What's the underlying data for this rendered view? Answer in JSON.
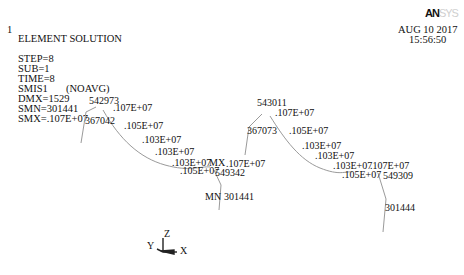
{
  "header": {
    "window_number": "1",
    "title": "ELEMENT SOLUTION",
    "step": "STEP=8",
    "sub": "SUB=1",
    "time": "TIME=8",
    "item": "SMIS1",
    "avg_mode": "(NOAVG)",
    "dmx": "DMX=1529",
    "smn": "SMN=301441",
    "smx": "SMX=.107E+07"
  },
  "logo": {
    "strong": "AN",
    "faded": "SYS"
  },
  "timestamp": {
    "date": "AUG 10 2017",
    "time": "15:56:50"
  },
  "left_member": {
    "labels": [
      {
        "text": "542973",
        "x": 89,
        "y": 96
      },
      {
        "text": ".107E+07",
        "x": 113,
        "y": 103
      },
      {
        "text": "367042",
        "x": 85,
        "y": 116
      },
      {
        "text": ".105E+07",
        "x": 124,
        "y": 121
      },
      {
        "text": ".103E+07",
        "x": 142,
        "y": 135
      },
      {
        "text": ".103E+07",
        "x": 155,
        "y": 147
      },
      {
        "text": ".103E+07",
        "x": 172,
        "y": 158
      },
      {
        "text": ".105E+07",
        "x": 180,
        "y": 166
      },
      {
        "text": "MX",
        "x": 209,
        "y": 158
      },
      {
        "text": ".107E+07",
        "x": 226,
        "y": 159
      },
      {
        "text": "549342",
        "x": 215,
        "y": 168
      },
      {
        "text": "MN",
        "x": 205,
        "y": 192
      },
      {
        "text": "301441",
        "x": 224,
        "y": 192
      }
    ]
  },
  "right_member": {
    "labels": [
      {
        "text": "543011",
        "x": 257,
        "y": 98
      },
      {
        "text": ".107E+07",
        "x": 275,
        "y": 108
      },
      {
        "text": "367073",
        "x": 247,
        "y": 126
      },
      {
        "text": ".105E+07",
        "x": 289,
        "y": 126
      },
      {
        "text": ".103E+07",
        "x": 302,
        "y": 141
      },
      {
        "text": ".103E+07",
        "x": 315,
        "y": 151
      },
      {
        "text": ".103E+07",
        "x": 333,
        "y": 161
      },
      {
        "text": ".107E+07",
        "x": 370,
        "y": 161
      },
      {
        "text": ".105E+07",
        "x": 342,
        "y": 170
      },
      {
        "text": "549309",
        "x": 383,
        "y": 171
      },
      {
        "text": "301444",
        "x": 385,
        "y": 203
      }
    ]
  },
  "triad": {
    "z": "Z",
    "y": "Y",
    "x": "X"
  }
}
